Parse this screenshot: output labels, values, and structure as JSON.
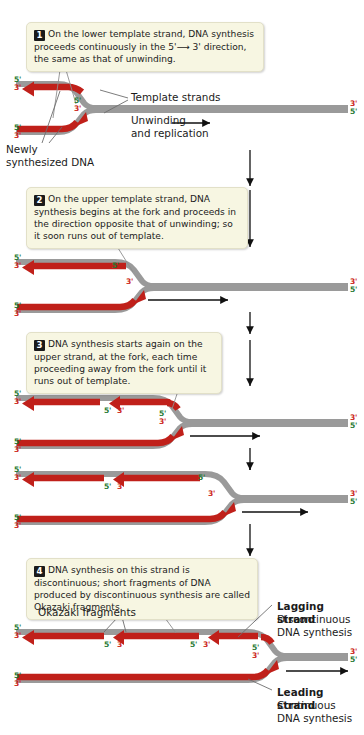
{
  "figure": {
    "colors": {
      "new_dna_red": "#c0201a",
      "template_gray": "#9a9a9a",
      "callout_bg": "#f7f6e2",
      "five_prime_green": "#1f7a33",
      "three_prime_red": "#cc2418"
    }
  },
  "steps": [
    {
      "number": "1",
      "text": "On the lower template strand, DNA synthesis proceeds continuously in the 5'⟶ 3' direction, the same as that of unwinding."
    },
    {
      "number": "2",
      "text": "On the upper template strand, DNA synthesis begins at the fork and proceeds in the direction opposite that of unwinding; so it soon runs out of template."
    },
    {
      "number": "3",
      "text": "DNA synthesis starts again on the upper strand, at the fork, each time proceeding away from the fork until it runs out of template."
    },
    {
      "number": "4",
      "text": "DNA synthesis on this strand is discontinuous; short fragments of DNA produced by discontinuous synthesis are called Okazaki fragments."
    }
  ],
  "labels": {
    "template_strands": "Template strands",
    "unwinding": "Unwinding",
    "and_replication": "and replication",
    "newly_line1": "Newly",
    "newly_line2": "synthesized DNA",
    "okazaki_fragments": "Okazaki fragments",
    "lagging_strand": "Lagging strand",
    "lagging_sub1": "Discontinuous",
    "lagging_sub2": "DNA synthesis",
    "leading_strand": "Leading strand",
    "leading_sub1": "Continuous",
    "leading_sub2": "DNA synthesis"
  },
  "ticks": {
    "five": "5'",
    "three": "3'"
  },
  "panels": [
    {
      "id": "panel-1",
      "step": "1",
      "end_ticks_left": [
        "5'",
        "3'",
        "5'",
        "3'"
      ],
      "end_ticks_right": [
        "3'",
        "5'"
      ],
      "fork_ticks": [
        "5'",
        "3'"
      ],
      "red_arrows": 2
    },
    {
      "id": "panel-2",
      "step": "2",
      "end_ticks_left": [
        "5'",
        "3'",
        "5'",
        "3'"
      ],
      "end_ticks_right": [
        "3'",
        "5'"
      ],
      "fork_ticks": [
        "5'",
        "3'"
      ],
      "upper_fragment_ticks": [
        "5'"
      ],
      "red_arrows": 2
    },
    {
      "id": "panel-3",
      "step": "3",
      "end_ticks_left": [
        "5'",
        "3'",
        "5'",
        "3'"
      ],
      "end_ticks_right": [
        "3'",
        "5'"
      ],
      "fork_ticks": [
        "5'",
        "3'"
      ],
      "upper_fragment_ticks": [
        "5'",
        "3'"
      ],
      "red_arrows": 3
    },
    {
      "id": "panel-4",
      "step": "",
      "end_ticks_left": [
        "5'",
        "3'",
        "5'",
        "3'"
      ],
      "end_ticks_right": [
        "3'",
        "5'"
      ],
      "fork_ticks": [
        "3'"
      ],
      "upper_fragment_ticks": [
        "5'",
        "3'",
        "5'"
      ],
      "red_arrows": 3
    },
    {
      "id": "panel-5",
      "step": "4",
      "end_ticks_left": [
        "5'",
        "3'",
        "5'",
        "3'"
      ],
      "end_ticks_right": [
        "3'",
        "5'"
      ],
      "fork_ticks": [
        "5'",
        "3'"
      ],
      "upper_fragment_ticks": [
        "5'",
        "3'",
        "5'",
        "3'"
      ],
      "red_arrows": 3
    }
  ]
}
